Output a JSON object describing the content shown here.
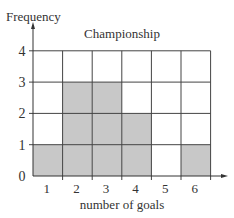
{
  "chart_data": {
    "type": "bar",
    "title": "Championship",
    "xlabel": "number of goals",
    "ylabel": "Frequency",
    "categories": [
      "1",
      "2",
      "3",
      "4",
      "5",
      "6"
    ],
    "values": [
      1,
      3,
      3,
      2,
      0,
      1
    ],
    "ylim": [
      0,
      4
    ],
    "yticks": [
      "0",
      "1",
      "2",
      "3",
      "4"
    ],
    "grid": true,
    "bar_color": "#c8c8c8",
    "grid_color": "#444444"
  }
}
